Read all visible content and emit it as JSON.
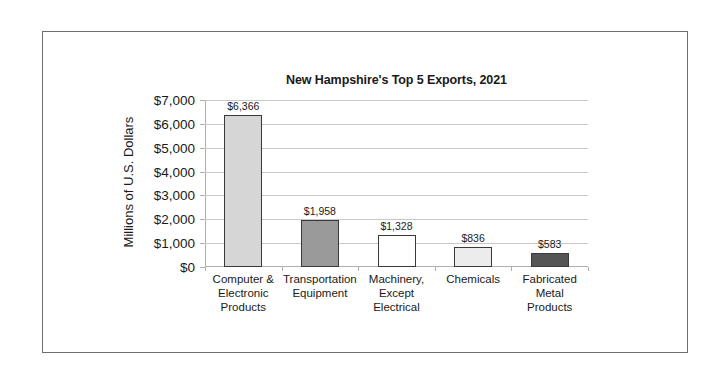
{
  "chart_data": {
    "type": "bar",
    "title": "New Hampshire's Top 5 Exports, 2021",
    "xlabel": "",
    "ylabel": "Millions of U.S. Dollars",
    "ylim": [
      0,
      7000
    ],
    "yticks": [
      "$0",
      "$1,000",
      "$2,000",
      "$3,000",
      "$4,000",
      "$5,000",
      "$6,000",
      "$7,000"
    ],
    "grid": true,
    "legend": null,
    "categories": [
      "Computer & Electronic Products",
      "Transportation Equipment",
      "Machinery, Except Electrical",
      "Chemicals",
      "Fabricated Metal Products"
    ],
    "category_lines": [
      [
        "Computer &",
        "Electronic",
        "Products"
      ],
      [
        "Transportation",
        "Equipment"
      ],
      [
        "Machinery,",
        "Except",
        "Electrical"
      ],
      [
        "Chemicals"
      ],
      [
        "Fabricated",
        "Metal",
        "Products"
      ]
    ],
    "values": [
      6366,
      1958,
      1328,
      836,
      583
    ],
    "data_labels": [
      "$6,366",
      "$1,958",
      "$1,328",
      "$836",
      "$583"
    ],
    "bar_colors": [
      "#d6d6d6",
      "#9a9a9a",
      "#ffffff",
      "#ececec",
      "#555555"
    ]
  }
}
